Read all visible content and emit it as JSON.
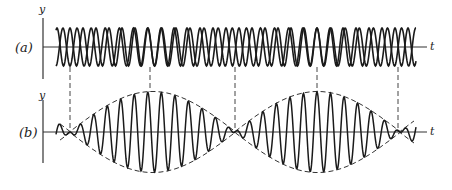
{
  "figure": {
    "panel_a": {
      "label": "(a)",
      "y_axis_label": "y",
      "x_axis_label": "t",
      "description": "Two superposed sinusoids of slightly different frequencies"
    },
    "panel_b": {
      "label": "(b)",
      "y_axis_label": "y",
      "x_axis_label": "t",
      "description": "Sum of the two waves showing beats with dashed envelope"
    }
  },
  "params": {
    "colors": {
      "ink": "#1a1a1a",
      "background": "#ffffff"
    },
    "x_start": 56,
    "x_end": 416,
    "node_x": [
      70,
      235,
      398
    ],
    "dash_x": [
      70,
      150,
      235,
      317,
      398
    ],
    "panel_a_axis_y": 47,
    "panel_a_amp": 19,
    "panel_b_axis_y": 132,
    "panel_b_amp": 40,
    "f1_cycles": 27,
    "f2_cycles": 25
  }
}
